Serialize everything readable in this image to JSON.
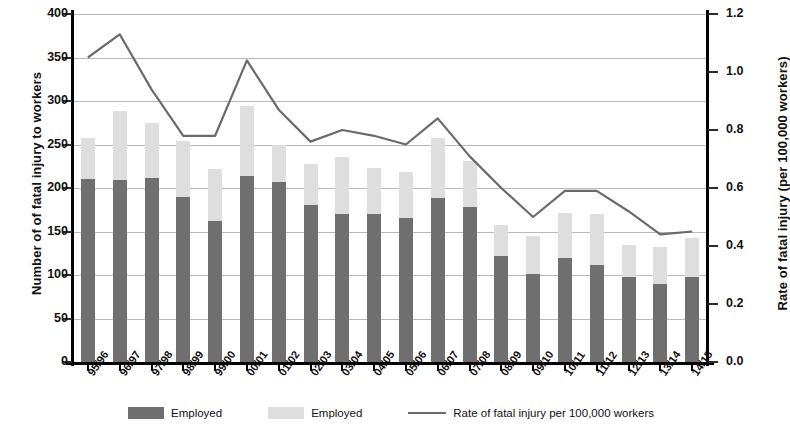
{
  "axes": {
    "left_title": "Number of  of fatal injury to workers",
    "right_title": "Rate of fatal injury (per 100,000 workers)",
    "left_ticks": [
      "0",
      "50",
      "100",
      "150",
      "200",
      "250",
      "300",
      "350",
      "400"
    ],
    "right_ticks": [
      "0.0",
      "0.2",
      "0.4",
      "0.6",
      "0.8",
      "1.0",
      "1.2"
    ]
  },
  "legend": {
    "employed_label": "Employed",
    "self_employed_label": "Employed",
    "rate_label": "Rate of fatal injury per 100,000 workers"
  },
  "chart_data": {
    "type": "bar",
    "title": "",
    "xlabel": "",
    "ylabel": "Number of  of fatal injury to workers",
    "y2label": "Rate of fatal injury (per 100,000 workers)",
    "ylim": [
      0,
      400
    ],
    "y2lim": [
      0,
      1.2
    ],
    "grid": true,
    "stacked": true,
    "legend_position": "bottom",
    "categories": [
      "95/96",
      "96/97",
      "97/98",
      "98/99",
      "99/00",
      "00/01",
      "01/02",
      "02/03",
      "03/04",
      "04/05",
      "05/06",
      "06/07",
      "07/08",
      "08/09",
      "09/10",
      "10/11",
      "11/12",
      "12/13",
      "13/14",
      "14/15"
    ],
    "series": [
      {
        "name": "Employed",
        "type": "bar",
        "axis": "left",
        "color": "#6f6f6f",
        "values": [
          210,
          209,
          212,
          190,
          162,
          214,
          207,
          181,
          170,
          170,
          166,
          189,
          178,
          122,
          101,
          119,
          112,
          98,
          90,
          98
        ]
      },
      {
        "name": "Employed",
        "type": "bar",
        "axis": "left",
        "color": "#dedede",
        "values": [
          48,
          80,
          63,
          64,
          60,
          80,
          42,
          47,
          66,
          53,
          52,
          69,
          53,
          36,
          44,
          52,
          58,
          36,
          42,
          44
        ]
      },
      {
        "name": "Rate of fatal injury per 100,000 workers",
        "type": "line",
        "axis": "right",
        "color": "#6a6a6a",
        "values": [
          1.05,
          1.13,
          0.94,
          0.78,
          0.78,
          1.04,
          0.87,
          0.76,
          0.8,
          0.78,
          0.75,
          0.84,
          0.71,
          0.6,
          0.5,
          0.59,
          0.59,
          0.52,
          0.44,
          0.45
        ]
      }
    ],
    "totals": [
      258,
      289,
      275,
      254,
      222,
      294,
      249,
      228,
      236,
      223,
      218,
      258,
      231,
      158,
      145,
      171,
      170,
      134,
      132,
      142
    ]
  }
}
